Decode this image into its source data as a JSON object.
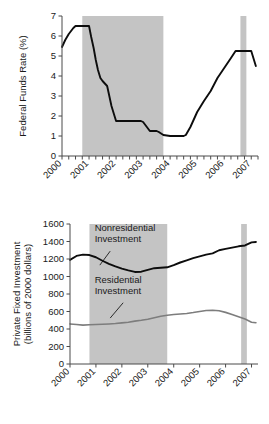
{
  "chart_data": [
    {
      "id": "fed-funds-rate",
      "type": "line",
      "title": "",
      "xlabel": "",
      "ylabel": "Federal Funds Rate (%)",
      "xlim": [
        2000.0,
        2007.25
      ],
      "ylim": [
        0,
        7
      ],
      "yticks": [
        0,
        1,
        2,
        3,
        4,
        5,
        6,
        7
      ],
      "ytick_labels": [
        "0",
        "1",
        "2",
        "3",
        "4",
        "5",
        "6",
        "7"
      ],
      "xticks": [
        2000,
        2001,
        2002,
        2003,
        2004,
        2005,
        2006,
        2007
      ],
      "xtick_labels": [
        "2000",
        "2001",
        "2002",
        "2003",
        "2004",
        "2005",
        "2006",
        "2007"
      ],
      "minor_xticks": true,
      "minor_xtick_interval": 0.25,
      "grid": false,
      "legend": "none",
      "shaded_regions": [
        {
          "name": "recession-2001",
          "x0": 2000.75,
          "x1": 2003.75,
          "color": "#c4c4c4"
        },
        {
          "name": "band-2006",
          "x0": 2006.6,
          "x1": 2006.82,
          "color": "#c4c4c4"
        }
      ],
      "series": [
        {
          "name": "Federal Funds Rate",
          "color": "#0d0d0d",
          "x": [
            2000.0,
            2000.12,
            2000.25,
            2000.42,
            2000.5,
            2000.75,
            2001.0,
            2001.08,
            2001.17,
            2001.25,
            2001.33,
            2001.42,
            2001.5,
            2001.67,
            2001.75,
            2001.83,
            2001.92,
            2002.0,
            2002.25,
            2002.5,
            2002.75,
            2002.92,
            2003.0,
            2003.25,
            2003.5,
            2003.58,
            2003.75,
            2004.0,
            2004.25,
            2004.5,
            2004.58,
            2004.75,
            2005.0,
            2005.25,
            2005.5,
            2005.75,
            2006.0,
            2006.25,
            2006.42,
            2006.5,
            2006.75,
            2007.0,
            2007.17
          ],
          "y": [
            5.45,
            5.8,
            6.1,
            6.4,
            6.5,
            6.5,
            6.5,
            5.95,
            5.4,
            4.8,
            4.3,
            3.9,
            3.75,
            3.5,
            3.0,
            2.5,
            2.1,
            1.75,
            1.75,
            1.75,
            1.75,
            1.75,
            1.7,
            1.25,
            1.25,
            1.2,
            1.05,
            1.0,
            1.0,
            1.0,
            1.05,
            1.45,
            2.2,
            2.75,
            3.25,
            3.9,
            4.4,
            4.9,
            5.25,
            5.25,
            5.25,
            5.25,
            4.5
          ]
        }
      ]
    },
    {
      "id": "private-fixed-investment",
      "type": "line",
      "title": "",
      "xlabel": "",
      "ylabel": "Private Fixed Investment (billions of 2000 dollars)",
      "xlim": [
        2000.0,
        2007.25
      ],
      "ylim": [
        0,
        1600
      ],
      "yticks": [
        0,
        200,
        400,
        600,
        800,
        1000,
        1200,
        1400,
        1600
      ],
      "ytick_labels": [
        "0",
        "200",
        "400",
        "600",
        "800",
        "1000",
        "1200",
        "1400",
        "1600"
      ],
      "xticks": [
        2000,
        2001,
        2002,
        2003,
        2004,
        2005,
        2006,
        2007
      ],
      "xtick_labels": [
        "2000",
        "2001",
        "2002",
        "2003",
        "2004",
        "2005",
        "2006",
        "2007"
      ],
      "minor_xticks": false,
      "grid": false,
      "legend": "inline-annotations",
      "shaded_regions": [
        {
          "name": "recession-2001",
          "x0": 2000.75,
          "x1": 2003.75,
          "color": "#c4c4c4"
        },
        {
          "name": "band-2006",
          "x0": 2006.6,
          "x1": 2006.82,
          "color": "#c4c4c4"
        }
      ],
      "annotations": [
        {
          "name": "nonresidential-label",
          "text_line1": "Nonresidential",
          "text_line2": "Investment",
          "x": 2000.95,
          "y": 1520
        },
        {
          "name": "residential-label",
          "text_line1": "Residential",
          "text_line2": "Investment",
          "x": 2000.95,
          "y": 930
        }
      ],
      "series": [
        {
          "name": "Nonresidential Investment",
          "color": "#0d0d0d",
          "x": [
            2000.0,
            2000.25,
            2000.5,
            2000.75,
            2001.0,
            2001.25,
            2001.5,
            2001.75,
            2002.0,
            2002.25,
            2002.5,
            2002.75,
            2003.0,
            2003.25,
            2003.5,
            2003.75,
            2004.0,
            2004.25,
            2004.5,
            2004.75,
            2005.0,
            2005.25,
            2005.5,
            2005.75,
            2006.0,
            2006.25,
            2006.5,
            2006.75,
            2007.0,
            2007.17
          ],
          "y": [
            1190,
            1235,
            1250,
            1245,
            1220,
            1180,
            1145,
            1115,
            1090,
            1070,
            1052,
            1055,
            1075,
            1095,
            1100,
            1105,
            1130,
            1160,
            1185,
            1210,
            1230,
            1250,
            1265,
            1300,
            1315,
            1330,
            1345,
            1355,
            1390,
            1395
          ]
        },
        {
          "name": "Residential Investment",
          "color": "#7d7d7d",
          "x": [
            2000.0,
            2000.25,
            2000.5,
            2000.75,
            2001.0,
            2001.25,
            2001.5,
            2001.75,
            2002.0,
            2002.25,
            2002.5,
            2002.75,
            2003.0,
            2003.25,
            2003.5,
            2003.75,
            2004.0,
            2004.25,
            2004.5,
            2004.75,
            2005.0,
            2005.25,
            2005.5,
            2005.75,
            2006.0,
            2006.25,
            2006.5,
            2006.75,
            2007.0,
            2007.17
          ],
          "y": [
            458,
            452,
            444,
            448,
            452,
            455,
            458,
            462,
            470,
            478,
            490,
            500,
            512,
            528,
            545,
            558,
            565,
            572,
            578,
            588,
            600,
            612,
            615,
            608,
            590,
            565,
            540,
            515,
            478,
            472
          ]
        }
      ]
    }
  ]
}
